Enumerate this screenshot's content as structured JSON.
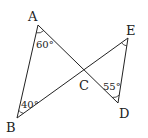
{
  "diagram": {
    "type": "geometry",
    "points": {
      "A": {
        "label": "A",
        "x": 38,
        "y": 25
      },
      "B": {
        "label": "B",
        "x": 17,
        "y": 118
      },
      "C": {
        "label": "C",
        "x": 84,
        "y": 70
      },
      "D": {
        "label": "D",
        "x": 118,
        "y": 103
      },
      "E": {
        "label": "E",
        "x": 128,
        "y": 38
      }
    },
    "segments": [
      {
        "from": "A",
        "to": "B"
      },
      {
        "from": "A",
        "to": "D"
      },
      {
        "from": "B",
        "to": "E"
      },
      {
        "from": "E",
        "to": "D"
      }
    ],
    "angles": [
      {
        "vertex": "A",
        "label": "60°"
      },
      {
        "vertex": "B",
        "label": "40°"
      },
      {
        "vertex": "D",
        "label": "55°"
      },
      {
        "vertex": "E",
        "label": ""
      }
    ],
    "stroke_color": "#222222"
  }
}
